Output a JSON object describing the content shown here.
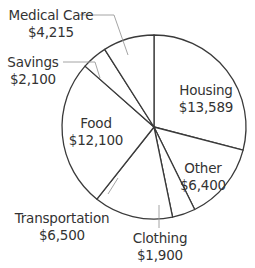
{
  "chart_data": {
    "type": "pie",
    "title": "",
    "start_angle_deg": -90,
    "direction": "clockwise",
    "center": [
      154,
      127
    ],
    "radius": 92,
    "categories": [
      "Housing",
      "Other",
      "Clothing",
      "Transportation",
      "Food",
      "Savings",
      "Medical Care"
    ],
    "values": [
      13589,
      6400,
      1900,
      6500,
      12100,
      2100,
      4215
    ],
    "value_labels": [
      "$13,589",
      "$6,400",
      "$1,900",
      "$6,500",
      "$12,100",
      "$2,100",
      "$4,215"
    ],
    "fill_color": "#ffffff",
    "stroke_color": "#3a3a3a",
    "leader_color": "#9a9a9a"
  },
  "labels": {
    "housing": {
      "name": "Housing",
      "value": "$13,589",
      "x": 206,
      "y": 82
    },
    "other": {
      "name": "Other",
      "value": "$6,400",
      "x": 203,
      "y": 160
    },
    "clothing": {
      "name": "Clothing",
      "value": "$1,900",
      "x": 160,
      "y": 230
    },
    "transport": {
      "name": "Transportation",
      "value": "$6,500",
      "x": 62,
      "y": 210
    },
    "food": {
      "name": "Food",
      "value": "$12,100",
      "x": 96,
      "y": 115
    },
    "savings": {
      "name": "Savings",
      "value": "$2,100",
      "x": 33,
      "y": 54
    },
    "medical": {
      "name": "Medical Care",
      "value": "$4,215",
      "x": 51,
      "y": 7
    }
  }
}
